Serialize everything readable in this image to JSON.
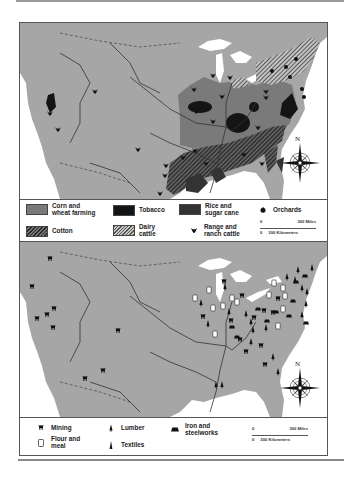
{
  "maps": [
    {
      "id": "agriculture",
      "legend": {
        "items": [
          {
            "label_line1": "Corn and",
            "label_line2": "wheat farming",
            "symbol": "swatch-solid-medium-gray"
          },
          {
            "label_line1": "Tobacco",
            "label_line2": "",
            "symbol": "swatch-solid-black"
          },
          {
            "label_line1": "Rice and",
            "label_line2": "sugar cane",
            "symbol": "swatch-solid-dark-gray"
          },
          {
            "label_line1": "Orchards",
            "label_line2": "",
            "symbol": "apple-icon"
          },
          {
            "label_line1": "Cotton",
            "label_line2": "",
            "symbol": "swatch-dark-hatch"
          },
          {
            "label_line1": "Dairy",
            "label_line2": "cattle",
            "symbol": "swatch-light-hatch"
          },
          {
            "label_line1": "Range and",
            "label_line2": "ranch cattle",
            "symbol": "cattle-head-icon"
          }
        ],
        "scale": {
          "zero": "0",
          "miles": "300 Miles",
          "km": "300 Kilometers"
        }
      },
      "compass": {
        "north_label": "N"
      }
    },
    {
      "id": "industry",
      "legend": {
        "items": [
          {
            "label_line1": "Mining",
            "label_line2": "",
            "symbol": "mine-cart-icon"
          },
          {
            "label_line1": "Lumber",
            "label_line2": "",
            "symbol": "tree-icon"
          },
          {
            "label_line1": "Iron and",
            "label_line2": "steelworks",
            "symbol": "furnace-icon"
          },
          {
            "label_line1": "Flour and",
            "label_line2": "meal",
            "symbol": "flour-sack-icon"
          },
          {
            "label_line1": "Textiles",
            "label_line2": "",
            "symbol": "spindle-icon"
          }
        ],
        "scale": {
          "zero": "0",
          "miles": "300 Miles",
          "km": "300 Kilometers"
        }
      },
      "compass": {
        "north_label": "N"
      }
    }
  ],
  "colors": {
    "land": "#a6a6a6",
    "water": "#ffffff",
    "corn_wheat": "#7a7a7a",
    "tobacco": "#141414",
    "rice_sugar": "#333333",
    "border": "#444444"
  }
}
